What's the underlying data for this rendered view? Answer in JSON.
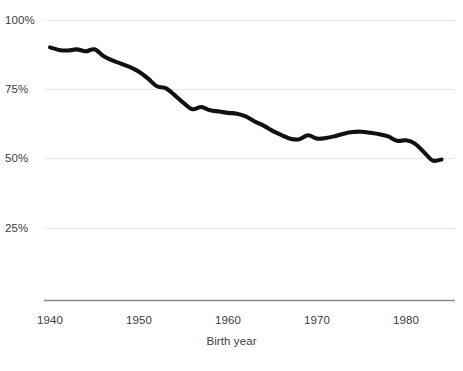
{
  "chart_data": {
    "type": "line",
    "title": "",
    "subtitle": "",
    "xlabel": "Birth year",
    "ylabel": "",
    "xlim": [
      1939.4,
      1985.0
    ],
    "ylim": [
      0,
      100
    ],
    "grid": true,
    "legend": false,
    "legend_position": "none",
    "line_color": "#111111",
    "grid_color": "#e8e8e8",
    "axis_color": "#8a8a8a",
    "text_color": "#3c3c3c",
    "background_color": "#ffffff",
    "y_ticks": [
      {
        "value": 100,
        "label": "100%"
      },
      {
        "value": 75,
        "label": "75%"
      },
      {
        "value": 50,
        "label": "50%"
      },
      {
        "value": 25,
        "label": "25%"
      }
    ],
    "x_ticks": [
      {
        "value": 1940,
        "label": "1940"
      },
      {
        "value": 1950,
        "label": "1950"
      },
      {
        "value": 1960,
        "label": "1960"
      },
      {
        "value": 1970,
        "label": "1970"
      },
      {
        "value": 1980,
        "label": "1980"
      }
    ],
    "series": [
      {
        "name": "share",
        "color": "#111111",
        "x": [
          1940,
          1941,
          1942,
          1943,
          1944,
          1945,
          1946,
          1947,
          1948,
          1949,
          1950,
          1951,
          1952,
          1953,
          1954,
          1955,
          1956,
          1957,
          1958,
          1959,
          1960,
          1961,
          1962,
          1963,
          1964,
          1965,
          1966,
          1967,
          1968,
          1969,
          1970,
          1971,
          1972,
          1973,
          1974,
          1975,
          1976,
          1977,
          1978,
          1979,
          1980,
          1981,
          1982,
          1983,
          1984
        ],
        "values": [
          90.3,
          89.4,
          89.2,
          89.6,
          88.9,
          89.6,
          87.2,
          85.6,
          84.4,
          83.2,
          81.5,
          79.1,
          76.3,
          75.6,
          73.1,
          70.3,
          68.0,
          68.8,
          67.6,
          67.2,
          66.7,
          66.4,
          65.4,
          63.6,
          62.1,
          60.2,
          58.7,
          57.4,
          57.2,
          58.6,
          57.4,
          57.6,
          58.3,
          59.2,
          59.8,
          59.9,
          59.5,
          59.0,
          58.2,
          56.6,
          56.8,
          55.6,
          52.6,
          49.5,
          49.9
        ],
        "end_value": 49.7
      }
    ]
  },
  "axis": {
    "x_title": "Birth year"
  }
}
